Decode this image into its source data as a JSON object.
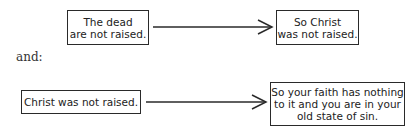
{
  "diagram": {
    "row1": {
      "source": {
        "lines": [
          "The dead",
          "are not raised."
        ]
      },
      "target": {
        "lines": [
          "So Christ",
          "was not raised."
        ]
      }
    },
    "connector_text": "and:",
    "row2": {
      "source": {
        "lines": [
          "Christ was not raised."
        ]
      },
      "target": {
        "lines": [
          "So your faith has nothing",
          "to it and you are in your",
          "old state of sin."
        ]
      }
    },
    "colors": {
      "stroke": "#2a2a2a",
      "text": "#222222",
      "background": "#ffffff"
    }
  }
}
